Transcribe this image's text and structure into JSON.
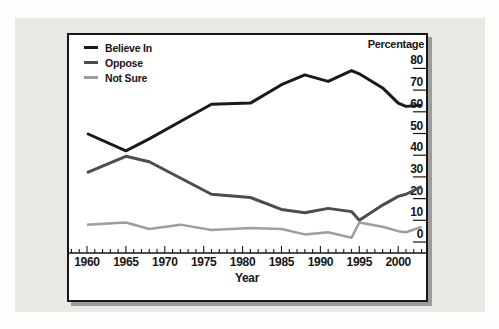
{
  "figure": {
    "page_color": "#fdfdfc",
    "panel_color": "#e8e8e4",
    "frame_border_color": "#161616",
    "frame_shadow_color": "#9b9b99"
  },
  "chart_data": {
    "type": "line",
    "title": "",
    "xlabel": "Year",
    "ylabel": "Percentage",
    "x": [
      1960,
      1965,
      1968,
      1972,
      1976,
      1981,
      1985,
      1988,
      1991,
      1994,
      1995,
      1998,
      2000,
      2001,
      2003
    ],
    "series": [
      {
        "name": "Believe In",
        "color": "#1a1a1a",
        "stroke_width": 3,
        "values": [
          50,
          42,
          47.5,
          55.5,
          63.5,
          64,
          72.5,
          77,
          74,
          79,
          77.5,
          71,
          64,
          62.5,
          63
        ]
      },
      {
        "name": "Oppose",
        "color": "#4d4d4d",
        "stroke_width": 3,
        "values": [
          32,
          39.5,
          37,
          29.5,
          22,
          20.5,
          15,
          13.5,
          15.5,
          14,
          10,
          17,
          21,
          22,
          25.5
        ]
      },
      {
        "name": "Not Sure",
        "color": "#9e9e9e",
        "stroke_width": 2.5,
        "values": [
          8,
          9,
          6,
          8,
          5.5,
          6.5,
          6,
          3.5,
          4.5,
          2,
          9,
          7,
          5,
          4.5,
          7
        ]
      }
    ],
    "ylim": [
      0,
      80
    ],
    "y_ticks": [
      0,
      10,
      20,
      30,
      40,
      50,
      60,
      70,
      80
    ],
    "x_major_ticks": [
      1960,
      1965,
      1970,
      1975,
      1980,
      1985,
      1990,
      1995,
      2000
    ],
    "x_minor_tick_range": [
      1958,
      2003
    ],
    "y_axis_side": "right",
    "legend_position": "top-left",
    "grid": false
  }
}
